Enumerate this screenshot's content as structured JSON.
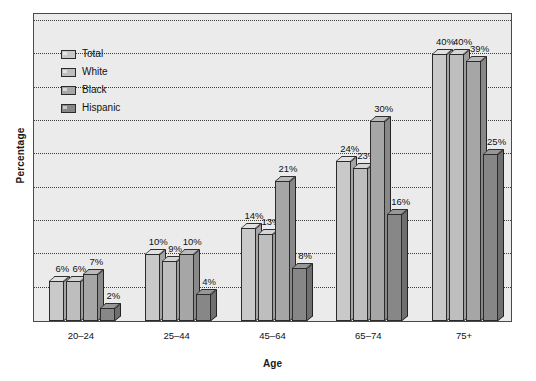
{
  "chart_data": {
    "type": "bar",
    "title": "",
    "xlabel": "Age",
    "ylabel": "Percentage",
    "categories": [
      "20–24",
      "25–44",
      "45–64",
      "65–74",
      "75+"
    ],
    "series": [
      {
        "name": "Total",
        "values": [
          6,
          10,
          14,
          24,
          40
        ],
        "color": "#c9c9c9"
      },
      {
        "name": "White",
        "values": [
          6,
          9,
          13,
          23,
          40
        ],
        "color": "#bebebe"
      },
      {
        "name": "Black",
        "values": [
          7,
          10,
          21,
          30,
          39
        ],
        "color": "#a6a6a6"
      },
      {
        "name": "Hispanic",
        "values": [
          2,
          4,
          8,
          16,
          25
        ],
        "color": "#878787"
      }
    ],
    "value_labels": [
      [
        "6%",
        "6%",
        "7%",
        "2%"
      ],
      [
        "10%",
        "9%",
        "10%",
        "4%"
      ],
      [
        "14%",
        "13%",
        "21%",
        "8%"
      ],
      [
        "24%",
        "23%",
        "30%",
        "16%"
      ],
      [
        "40%",
        "40%",
        "39%",
        "25%"
      ]
    ],
    "ylim": [
      0,
      45
    ],
    "ytick_interval": 5,
    "ytick_labels_shown": false,
    "grid": true,
    "grid_style": "dotted",
    "legend_position": "top-left-inside",
    "legend_entries": [
      "Total",
      "White",
      "Black",
      "Hispanic"
    ],
    "bar_style": "3d-extruded",
    "plot_background": "#ebebeb",
    "page_background": "#ffffff",
    "frame_color": "#4a4a4a"
  }
}
